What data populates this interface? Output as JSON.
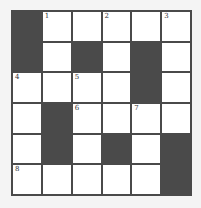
{
  "puzzle": {
    "rows": 6,
    "cols": 6,
    "colors": {
      "block": "#4a4a4a",
      "cell": "#ffffff",
      "background": "#f4f4f4"
    },
    "grid": [
      [
        {
          "b": 1
        },
        {
          "n": "1"
        },
        {},
        {
          "n": "2"
        },
        {},
        {
          "n": "3"
        }
      ],
      [
        {
          "b": 1
        },
        {},
        {
          "b": 1
        },
        {},
        {
          "b": 1
        },
        {}
      ],
      [
        {
          "n": "4"
        },
        {},
        {
          "n": "5"
        },
        {},
        {
          "b": 1
        },
        {}
      ],
      [
        {},
        {
          "b": 1
        },
        {
          "n": "6"
        },
        {},
        {
          "n": "7"
        },
        {}
      ],
      [
        {},
        {
          "b": 1
        },
        {},
        {
          "b": 1
        },
        {},
        {
          "b": 1
        }
      ],
      [
        {
          "n": "8"
        },
        {},
        {},
        {},
        {},
        {
          "b": 1
        }
      ]
    ]
  }
}
